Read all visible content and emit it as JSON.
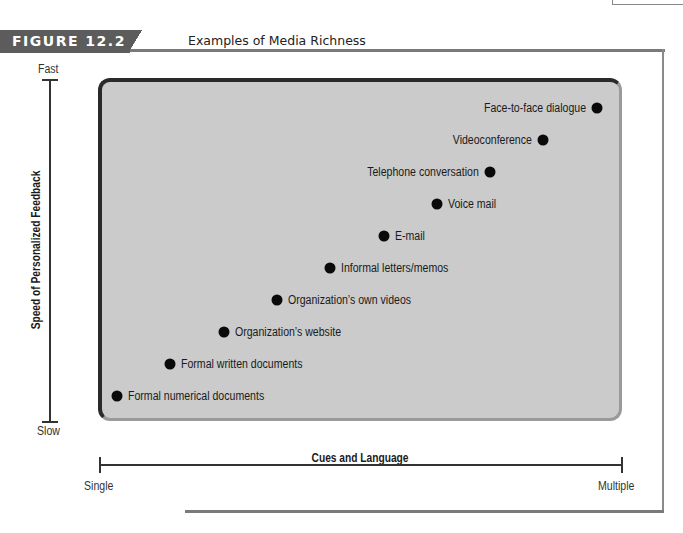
{
  "figure": {
    "number_label": "FIGURE 12.2",
    "title": "Examples of Media Richness",
    "tab_color": "#5c5c5c",
    "plot_fill": "#cbcbcb"
  },
  "axes": {
    "y": {
      "title": "Speed of Personalized Feedback",
      "top_label": "Fast",
      "bottom_label": "Slow"
    },
    "x": {
      "title": "Cues and Language",
      "left_label": "Single",
      "right_label": "Multiple"
    }
  },
  "points": [
    {
      "label": "Formal numerical documents",
      "side": "right"
    },
    {
      "label": "Formal written documents",
      "side": "right"
    },
    {
      "label": "Organization’s website",
      "side": "right"
    },
    {
      "label": "Organization’s own videos",
      "side": "right"
    },
    {
      "label": "Informal letters/memos",
      "side": "right"
    },
    {
      "label": "E-mail",
      "side": "right"
    },
    {
      "label": "Voice mail",
      "side": "right"
    },
    {
      "label": "Telephone conversation",
      "side": "left"
    },
    {
      "label": "Videoconference",
      "side": "left"
    },
    {
      "label": "Face-to-face dialogue",
      "side": "left"
    }
  ],
  "chart_data": {
    "type": "scatter",
    "title": "Examples of Media Richness",
    "xlabel": "Cues and Language",
    "ylabel": "Speed of Personalized Feedback",
    "x_range_labels": [
      "Single",
      "Multiple"
    ],
    "y_range_labels": [
      "Slow",
      "Fast"
    ],
    "grid": false,
    "legend": "none",
    "points": [
      {
        "label": "Formal numerical documents",
        "x": 1,
        "y": 1
      },
      {
        "label": "Formal written documents",
        "x": 2,
        "y": 2
      },
      {
        "label": "Organization’s website",
        "x": 3,
        "y": 3
      },
      {
        "label": "Organization’s own videos",
        "x": 4,
        "y": 4
      },
      {
        "label": "Informal letters/memos",
        "x": 5,
        "y": 5
      },
      {
        "label": "E-mail",
        "x": 6,
        "y": 6
      },
      {
        "label": "Voice mail",
        "x": 7,
        "y": 7
      },
      {
        "label": "Telephone conversation",
        "x": 8,
        "y": 8
      },
      {
        "label": "Videoconference",
        "x": 9,
        "y": 9
      },
      {
        "label": "Face-to-face dialogue",
        "x": 10,
        "y": 10
      }
    ]
  }
}
